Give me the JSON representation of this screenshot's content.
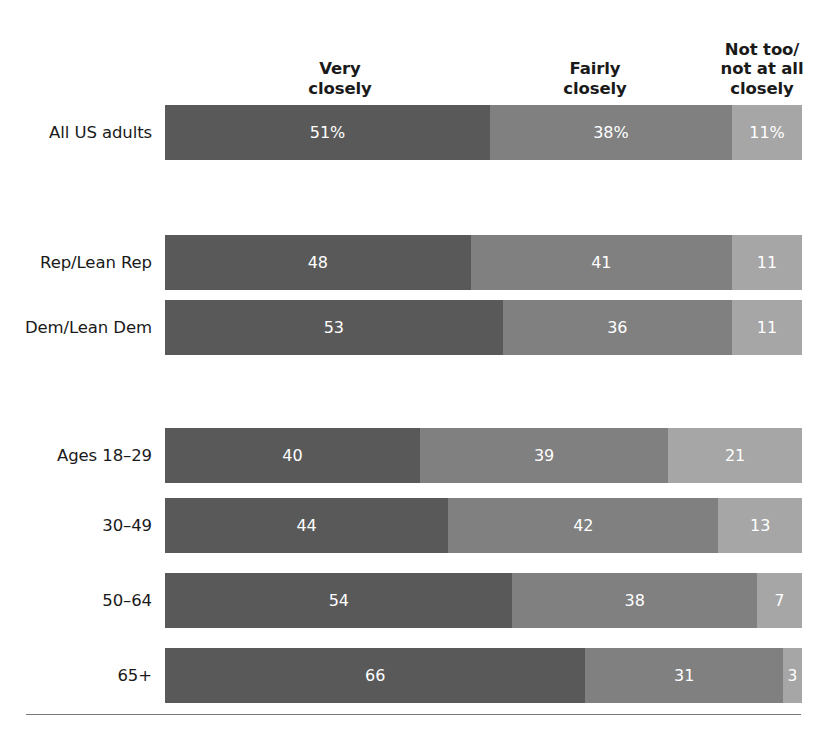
{
  "chart_data": {
    "type": "bar",
    "subtype": "stacked-horizontal-100pct",
    "title": "",
    "subtitle": "",
    "xlabel": "",
    "ylabel": "",
    "xlim": [
      0,
      100
    ],
    "grid": false,
    "legend_position": "top",
    "value_unit": "%",
    "categories": [
      "All US adults",
      "Rep/Lean Rep",
      "Dem/Lean Dem",
      "Ages 18–29",
      "30–49",
      "50–64",
      "65+"
    ],
    "series": [
      {
        "name": "Very closely",
        "color": "#595959",
        "values": [
          51,
          48,
          53,
          40,
          44,
          54,
          66
        ]
      },
      {
        "name": "Fairly closely",
        "color": "#808080",
        "values": [
          38,
          41,
          36,
          39,
          42,
          38,
          31
        ]
      },
      {
        "name": "Not too/not at all closely",
        "color": "#a6a6a6",
        "values": [
          11,
          11,
          11,
          21,
          13,
          7,
          3
        ]
      }
    ],
    "data_labels": [
      [
        "51%",
        "38%",
        "11%"
      ],
      [
        "48",
        "41",
        "11"
      ],
      [
        "53",
        "36",
        "11"
      ],
      [
        "40",
        "39",
        "21"
      ],
      [
        "44",
        "42",
        "13"
      ],
      [
        "54",
        "38",
        "7"
      ],
      [
        "66",
        "31",
        "3"
      ]
    ]
  },
  "headers": [
    {
      "id": "very",
      "label": "Very\ncloselyticker"
    },
    {
      "id": "fairly",
      "label": "Fairly\nclosely"
    },
    {
      "id": "nottoo",
      "label": "Not too/\nnot at all\nclosely"
    }
  ],
  "header_labels": {
    "very": "Very\nclosely",
    "fairly": "Fairly\nclosely",
    "nottoo": "Not too/\nnot at all\nclosely"
  },
  "rows": [
    {
      "label": "All US adults",
      "group": "total",
      "segments": [
        {
          "name": "Very closely",
          "value": 51,
          "display": "51%",
          "color": "#595959"
        },
        {
          "name": "Fairly closely",
          "value": 38,
          "display": "38%",
          "color": "#808080"
        },
        {
          "name": "Not too/not at all closely",
          "value": 11,
          "display": "11%",
          "color": "#a6a6a6"
        }
      ]
    },
    {
      "label": "Rep/Lean Rep",
      "group": "party",
      "segments": [
        {
          "name": "Very closely",
          "value": 48,
          "display": "48",
          "color": "#595959"
        },
        {
          "name": "Fairly closely",
          "value": 41,
          "display": "41",
          "color": "#808080"
        },
        {
          "name": "Not too/not at all closely",
          "value": 11,
          "display": "11",
          "color": "#a6a6a6"
        }
      ]
    },
    {
      "label": "Dem/Lean Dem",
      "group": "party",
      "segments": [
        {
          "name": "Very closely",
          "value": 53,
          "display": "53",
          "color": "#595959"
        },
        {
          "name": "Fairly closely",
          "value": 36,
          "display": "36",
          "color": "#808080"
        },
        {
          "name": "Not too/not at all closely",
          "value": 11,
          "display": "11",
          "color": "#a6a6a6"
        }
      ]
    },
    {
      "label": "Ages 18–29",
      "group": "age",
      "segments": [
        {
          "name": "Very closely",
          "value": 40,
          "display": "40",
          "color": "#595959"
        },
        {
          "name": "Fairly closely",
          "value": 39,
          "display": "39",
          "color": "#808080"
        },
        {
          "name": "Not too/not at all closely",
          "value": 21,
          "display": "21",
          "color": "#a6a6a6"
        }
      ]
    },
    {
      "label": "30–49",
      "group": "age",
      "segments": [
        {
          "name": "Very closely",
          "value": 44,
          "display": "44",
          "color": "#595959"
        },
        {
          "name": "Fairly closely",
          "value": 42,
          "display": "42",
          "color": "#808080"
        },
        {
          "name": "Not too/not at all closely",
          "value": 13,
          "display": "13",
          "color": "#a6a6a6"
        }
      ]
    },
    {
      "label": "50–64",
      "group": "age",
      "segments": [
        {
          "name": "Very closely",
          "value": 54,
          "display": "54",
          "color": "#595959"
        },
        {
          "name": "Fairly closely",
          "value": 38,
          "display": "38",
          "color": "#808080"
        },
        {
          "name": "Not too/not at all closely",
          "value": 7,
          "display": "7",
          "color": "#a6a6a6"
        }
      ]
    },
    {
      "label": "65+",
      "group": "age",
      "segments": [
        {
          "name": "Very closely",
          "value": 66,
          "display": "66",
          "color": "#595959"
        },
        {
          "name": "Fairly closely",
          "value": 31,
          "display": "31",
          "color": "#808080"
        },
        {
          "name": "Not too/not at all closely",
          "value": 3,
          "display": "3",
          "color": "#a6a6a6"
        }
      ]
    }
  ],
  "layout": {
    "bar_left": 165,
    "bar_width": 637,
    "row_height": 55,
    "row_tops": [
      105,
      235,
      300,
      428,
      498,
      573,
      648
    ],
    "rule_top": 714
  },
  "colors": {
    "very_closely": "#595959",
    "fairly_closely": "#808080",
    "not_too_closely": "#a6a6a6",
    "text": "#1a1a1a",
    "label_on_bar": "#ffffff",
    "rule": "#7a7a7a",
    "background": "#ffffff"
  }
}
